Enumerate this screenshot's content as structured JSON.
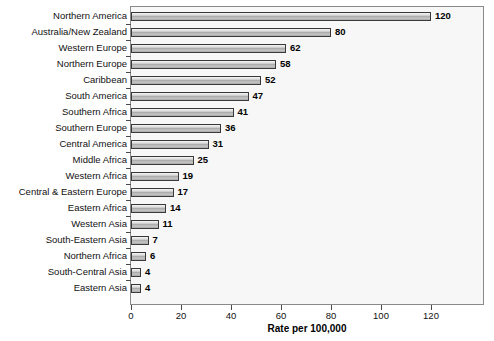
{
  "chart_data": {
    "type": "bar",
    "orientation": "horizontal",
    "title": "",
    "xlabel": "Rate per 100,000",
    "ylabel": "",
    "xlim": [
      0,
      141.6
    ],
    "xticks": [
      0,
      20,
      40,
      60,
      80,
      100,
      120
    ],
    "xticklabels": [
      "0",
      "20",
      "40",
      "60",
      "80",
      "100",
      "120"
    ],
    "grid": false,
    "legend": null,
    "categories": [
      "Northern America",
      "Australia/New Zealand",
      "Western Europe",
      "Northern Europe",
      "Caribbean",
      "South America",
      "Southern Africa",
      "Southern Europe",
      "Central America",
      "Middle Africa",
      "Western Africa",
      "Central & Eastern Europe",
      "Eastern Africa",
      "Western Asia",
      "South-Eastern Asia",
      "Northern Africa",
      "South-Central Asia",
      "Eastern Asia"
    ],
    "values": [
      120,
      80,
      62,
      58,
      52,
      47,
      41,
      36,
      31,
      25,
      19,
      17,
      14,
      11,
      7,
      6,
      4,
      4
    ],
    "value_labels": [
      "120",
      "80",
      "62",
      "58",
      "52",
      "47",
      "41",
      "36",
      "31",
      "25",
      "19",
      "17",
      "14",
      "11",
      "7",
      "6",
      "4",
      "4"
    ],
    "colors": {
      "plot_background": "#f7f7f7",
      "page_background": "#ffffff",
      "bar_outline": "#3a3a3a",
      "bar_fill_light": "#f2f2f2",
      "bar_fill_dark": "#a9a9a9",
      "axis": "#8a8a8a",
      "text": "#000000"
    }
  }
}
